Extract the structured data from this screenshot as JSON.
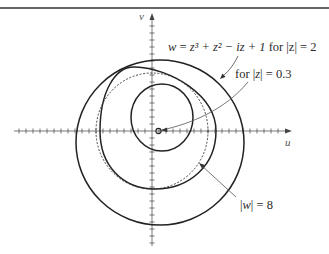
{
  "figure": {
    "axes": {
      "x_label": "u",
      "y_label": "v",
      "tick_spacing_px": 7
    },
    "annotations": {
      "main_curve": {
        "lhs": "w",
        "eq": " = ",
        "rhs": "z³ + z² − iz + 1",
        "cond": " for |z| = 2"
      },
      "small_curve": {
        "prefix": "for |",
        "var": "z",
        "suffix": "| = 0.3"
      },
      "dashed_circle": {
        "prefix": "|",
        "var": "w",
        "suffix": "| = 8"
      }
    },
    "curves": [
      {
        "name": "image of |z|=2 outer loop",
        "style": "solid"
      },
      {
        "name": "image of |z|=2 middle loop",
        "style": "solid"
      },
      {
        "name": "image of |z|=2 inner loop",
        "style": "solid"
      },
      {
        "name": "|w| = 8 circle",
        "style": "dashed"
      },
      {
        "name": "image of |z|=0.3",
        "style": "solid, small"
      }
    ]
  }
}
